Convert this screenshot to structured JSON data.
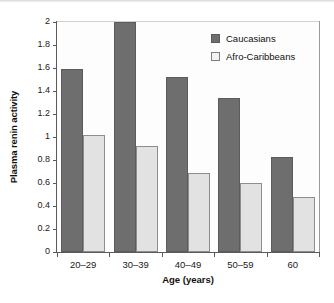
{
  "chart_data": {
    "type": "bar",
    "title": "",
    "subtitle": "",
    "xlabel": "Age (years)",
    "ylabel": "Plasma renin activity",
    "categories": [
      "20–29",
      "30–39",
      "40–49",
      "50–59",
      "60"
    ],
    "series": [
      {
        "name": "Caucasians",
        "color": "#6e6e6e",
        "values": [
          1.59,
          2.0,
          1.52,
          1.34,
          0.83
        ]
      },
      {
        "name": "Afro-Caribbeans",
        "color": "#e2e2e2",
        "values": [
          1.02,
          0.92,
          0.69,
          0.6,
          0.48
        ]
      }
    ],
    "ylim": [
      0,
      2
    ],
    "ytick_labels": [
      "0",
      "0.2",
      "0.4",
      "0.6",
      "0.8",
      "1",
      "1.2",
      "1.4",
      "1.6",
      "1.8",
      "2"
    ],
    "ytick_values": [
      0,
      0.2,
      0.4,
      0.6,
      0.8,
      1,
      1.2,
      1.4,
      1.6,
      1.8,
      2
    ],
    "grid": false,
    "legend_position": "top-right"
  },
  "legend": {
    "entries": [
      {
        "label": "Caucasians"
      },
      {
        "label": "Afro-Caribbeans"
      }
    ]
  },
  "axes": {
    "x_title": "Age (years)",
    "y_title": "Plasma renin activity"
  }
}
